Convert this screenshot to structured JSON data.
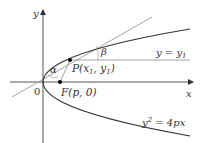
{
  "diagram": {
    "axes": {
      "x_label": "x",
      "y_label": "y",
      "origin_label": "0"
    },
    "curve": {
      "equation_label": "y² = 4px",
      "eq_y": "y",
      "eq_exp": "2",
      "eq_rest": " = 4px"
    },
    "points": {
      "P": {
        "label": "P(x",
        "sub1": "1",
        "mid": ", y",
        "sub2": "1",
        "end": ")"
      },
      "F": {
        "label": "F(p, 0)"
      }
    },
    "lines": {
      "horizontal": {
        "label_prefix": "y = y",
        "label_sub": "1"
      },
      "tangent": {
        "label": "tangent line at P"
      }
    },
    "angles": {
      "alpha": "α",
      "beta": "β"
    },
    "colors": {
      "axis": "#555555",
      "curve": "#333333",
      "tangent": "#999999",
      "horizontal": "#999999",
      "point": "#000000"
    }
  }
}
